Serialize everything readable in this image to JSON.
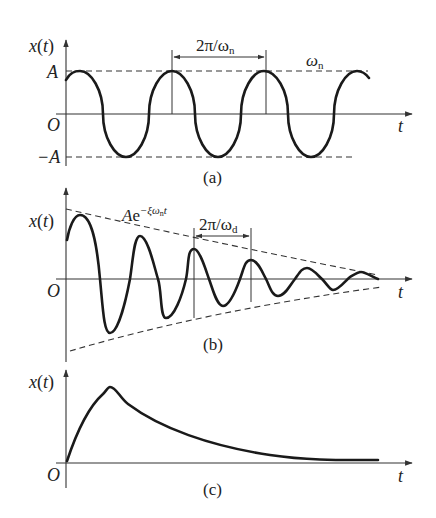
{
  "panels": [
    {
      "id": "a",
      "caption": "(a)",
      "y_label": "x(t)",
      "x_label": "t",
      "origin_label": "O",
      "amp_label": "A",
      "neg_amp_label": "−A",
      "period_label_main": "2π/ω",
      "period_label_sub": "n",
      "freq_label_main": "ω",
      "freq_label_sub": "n",
      "description": "Undamped free vibration: constant-amplitude sinusoid"
    },
    {
      "id": "b",
      "caption": "(b)",
      "y_label": "x(t)",
      "x_label": "t",
      "origin_label": "O",
      "envelope_label_main": "Ae",
      "envelope_label_sup": "−ξω",
      "envelope_label_sup_sub": "n",
      "envelope_label_sup_tail": "t",
      "period_label_main": "2π/ω",
      "period_label_sub": "d",
      "description": "Underdamped vibration: decaying oscillation within exponential envelope"
    },
    {
      "id": "c",
      "caption": "(c)",
      "y_label": "x(t)",
      "x_label": "t",
      "origin_label": "O",
      "description": "Overdamped/critically damped response: rises to a peak then decays without oscillation"
    }
  ],
  "colors": {
    "ink": "#1a1a1a",
    "axis": "#333333",
    "background": "#ffffff"
  }
}
